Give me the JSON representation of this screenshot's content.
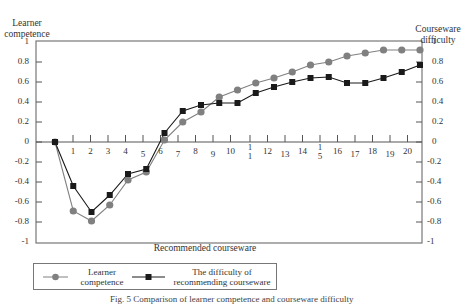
{
  "chart_data": {
    "type": "line",
    "title": "",
    "xlabel": "Recommended courseware",
    "ylabel_left": "Learner competence",
    "ylabel_right": "Courseware difficulty",
    "ylim": [
      -1,
      1
    ],
    "yticks": [
      "1",
      "0.8",
      "0.6",
      "0.4",
      "0.2",
      "0",
      "-0.2",
      "-0.4",
      "-0.6",
      "-0.8",
      "-1"
    ],
    "xtick_labels": [
      "1",
      "2",
      "3",
      "4",
      "5",
      "6",
      "7",
      "8",
      "9",
      "10",
      "1\n1",
      "12",
      "13",
      "14",
      "1\n5",
      "16",
      "17",
      "18",
      "19",
      "20"
    ],
    "x": [
      0,
      1,
      2,
      3,
      4,
      5,
      6,
      7,
      8,
      9,
      10,
      11,
      12,
      13,
      14,
      15,
      16,
      17,
      18,
      19,
      20
    ],
    "grid": false,
    "legend_position": "bottom",
    "series": [
      {
        "name": "Learner competence",
        "marker": "circle",
        "color": "#808080",
        "values": [
          0,
          -0.69,
          -0.79,
          -0.63,
          -0.38,
          -0.3,
          0.02,
          0.2,
          0.3,
          0.45,
          0.52,
          0.59,
          0.64,
          0.7,
          0.77,
          0.8,
          0.86,
          0.89,
          0.92,
          0.92,
          0.92
        ]
      },
      {
        "name": "The difficulty of recommending courseware",
        "marker": "square",
        "color": "#1a1a1a",
        "values": [
          0,
          -0.44,
          -0.7,
          -0.53,
          -0.32,
          -0.27,
          0.09,
          0.31,
          0.37,
          0.39,
          0.39,
          0.49,
          0.55,
          0.6,
          0.64,
          0.65,
          0.59,
          0.59,
          0.64,
          0.7,
          0.77
        ]
      }
    ]
  },
  "labels": {
    "left_axis_title_line1": "Learner",
    "left_axis_title_line2": "competence",
    "right_axis_title_line1": "Courseware",
    "right_axis_title_line2": "difficulty",
    "x_axis_title": "Recommended courseware",
    "legend_series1_line1": "Learner",
    "legend_series1_line2": "competence",
    "legend_series2_line1": "The difficulty of",
    "legend_series2_line2": "recommending courseware",
    "caption": "Fig. 5  Comparison of learner competence and courseware difficulty"
  }
}
